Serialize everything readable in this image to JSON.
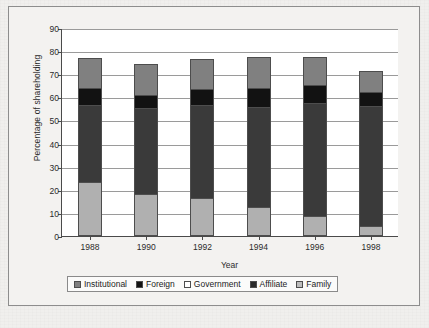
{
  "chart_data": {
    "type": "bar",
    "subtype": "stacked-bar",
    "title": "",
    "xlabel": "Year",
    "ylabel": "Percentage of shareholding",
    "categories": [
      "1988",
      "1990",
      "1992",
      "1994",
      "1996",
      "1998"
    ],
    "ylim": [
      0,
      90
    ],
    "yticks": [
      0,
      10,
      20,
      30,
      40,
      50,
      60,
      70,
      80,
      90
    ],
    "grid": true,
    "legend_position": "bottom",
    "stack_order_bottom_to_top": [
      "Family",
      "Affiliate",
      "Foreign",
      "Government",
      "Institutional"
    ],
    "series": [
      {
        "name": "Institutional",
        "color": "#808080",
        "values": [
          13.0,
          13.5,
          13.0,
          13.5,
          12.0,
          9.0
        ]
      },
      {
        "name": "Foreign",
        "color": "#121212",
        "values": [
          7.0,
          5.5,
          6.5,
          8.0,
          7.5,
          6.0
        ]
      },
      {
        "name": "Government",
        "color": "#ffffff",
        "values": [
          0,
          0,
          0,
          0,
          0,
          0
        ]
      },
      {
        "name": "Affiliate",
        "color": "#3a3a3a",
        "values": [
          34.0,
          37.5,
          41.0,
          44.0,
          50.0,
          53.0
        ]
      },
      {
        "name": "Family",
        "color": "#b0b0b0",
        "values": [
          23.0,
          18.0,
          16.0,
          12.0,
          8.0,
          3.5
        ]
      }
    ],
    "totals": [
      77.0,
      74.5,
      76.5,
      77.5,
      77.5,
      71.5
    ]
  },
  "legend": {
    "items": [
      {
        "label": "Institutional",
        "key": "institutional"
      },
      {
        "label": "Foreign",
        "key": "foreign"
      },
      {
        "label": "Government",
        "key": "government"
      },
      {
        "label": "Affiliate",
        "key": "affiliate"
      },
      {
        "label": "Family",
        "key": "family"
      }
    ]
  }
}
